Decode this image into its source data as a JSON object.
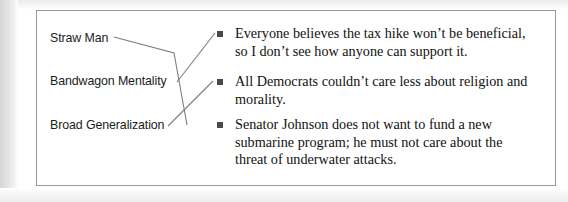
{
  "exercise": {
    "type": "matching-exercise",
    "terms": [
      {
        "id": "straw-man",
        "label": "Straw Man"
      },
      {
        "id": "bandwagon-mentality",
        "label": "Bandwagon Mentality"
      },
      {
        "id": "broad-generalization",
        "label": "Broad Generalization"
      }
    ],
    "statements": [
      {
        "id": "statement-1",
        "bullet": "square-bullet-icon",
        "text": "Everyone believes the tax hike won’t be beneficial, so I don’t see how anyone can support it."
      },
      {
        "id": "statement-2",
        "bullet": "square-bullet-icon",
        "text": "All Democrats couldn’t care less about religion and morality."
      },
      {
        "id": "statement-3",
        "bullet": "square-bullet-icon",
        "text": "Senator Johnson does not want to fund a new submarine program; he must not care about the threat of underwater attacks."
      }
    ],
    "connections": [
      {
        "id": "connection-straw-man",
        "from": "straw-man",
        "to": "statement-3"
      },
      {
        "id": "connection-bandwagon-mentality",
        "from": "bandwagon-mentality",
        "to": "statement-1"
      },
      {
        "id": "connection-broad-generalization",
        "from": "broad-generalization",
        "to": "statement-2"
      }
    ]
  },
  "colors": {
    "page_background": "#ffffff",
    "scan_gutter": "#e8e8e8",
    "box_border": "#9a9a9a",
    "bullet": "#4a4a4a",
    "connector_line": "#7d7d7d",
    "term_text": "#1c1c1c",
    "statement_text": "#111111"
  }
}
